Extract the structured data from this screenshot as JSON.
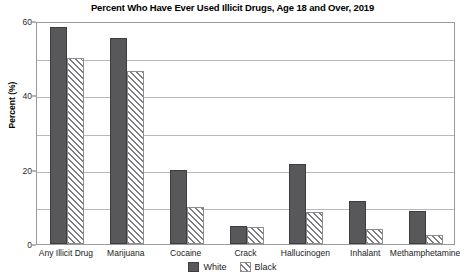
{
  "chart_data": {
    "type": "bar",
    "title": "Percent Who Have Ever Used Illicit Drugs, Age 18 and Over, 2019",
    "xlabel": "",
    "ylabel": "Percent (%)",
    "ylim": [
      0,
      60
    ],
    "yticks": [
      0,
      20,
      40,
      60
    ],
    "ytick_labels": [
      "0",
      "20",
      "40",
      "60"
    ],
    "gridlines": [
      10,
      20,
      30,
      40,
      50
    ],
    "grid": true,
    "legend_position": "bottom-center",
    "categories": [
      "Any Illicit Drug",
      "Marijuana",
      "Cocaine",
      "Crack",
      "Hallucinogen",
      "Inhalant",
      "Methamphetamine"
    ],
    "series": [
      {
        "name": "White",
        "style": "solid",
        "color": "#58585a",
        "values": [
          58.5,
          55.5,
          20.0,
          4.8,
          21.5,
          11.5,
          9.0
        ]
      },
      {
        "name": "Black",
        "style": "diagonal-hatch",
        "color": "#7d7d7f",
        "values": [
          50.0,
          46.5,
          10.0,
          4.5,
          8.5,
          4.0,
          2.5
        ]
      }
    ]
  },
  "legend": {
    "items": [
      {
        "label": "White"
      },
      {
        "label": "Black"
      }
    ]
  }
}
